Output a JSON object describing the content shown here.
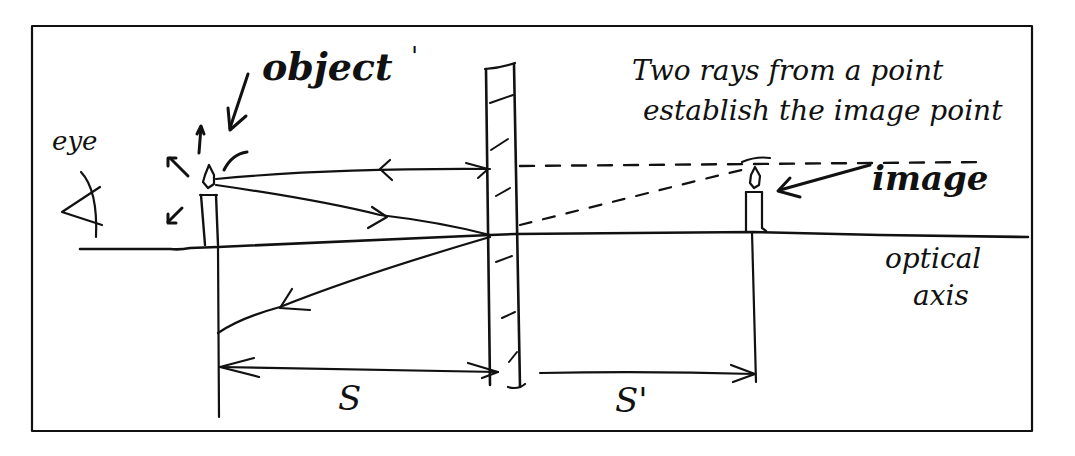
{
  "figure": {
    "type": "hand-drawn optics ray diagram",
    "colors": {
      "ink": "#111111",
      "background": "#ffffff",
      "frame": "#111111"
    }
  },
  "labels": {
    "eye": "eye",
    "object": "object",
    "object_mark": "'",
    "note_line1": "Two rays from a point",
    "note_line2": "establish the image point",
    "image": "image",
    "axis_line1": "optical",
    "axis_line2": "axis",
    "object_distance": "S",
    "image_distance": "S'"
  },
  "elements": {
    "eye_icon": "eye-symbol",
    "object_icon": "candle",
    "image_icon": "candle-virtual-image",
    "mirror": "hatched-plane-mirror",
    "rays": [
      {
        "name": "ray-parallel-to-axis",
        "style": "solid",
        "direction": "to-mirror-and-reflect-back"
      },
      {
        "name": "ray-to-mirror-center",
        "style": "solid",
        "direction": "incident-then-reflected-down-left"
      },
      {
        "name": "virtual-ray-horizontal",
        "style": "dashed"
      },
      {
        "name": "virtual-ray-diagonal",
        "style": "dashed"
      }
    ]
  }
}
